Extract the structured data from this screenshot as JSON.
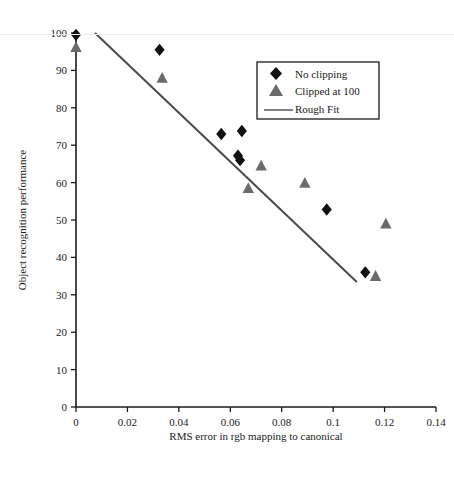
{
  "figure": {
    "background_color": "#ffffff",
    "axis_color": "#1a1a1a",
    "series_colors": {
      "no_clipping": "#111111",
      "clipped_at_100": "#6b6b6b",
      "rough_fit": "#4a4a4a"
    }
  },
  "chart_data": {
    "type": "scatter",
    "title": "",
    "xlabel": "RMS  error  in rgb mapping to canonical",
    "ylabel": "Object recognition performance",
    "xlim": [
      0,
      0.14
    ],
    "ylim": [
      0,
      100
    ],
    "xticks": [
      0,
      0.02,
      0.04,
      0.06,
      0.08,
      0.1,
      0.12,
      0.14
    ],
    "xtick_labels": [
      "0",
      "0.02",
      "0.04",
      "0.06",
      "0.08",
      "0.1",
      "0.12",
      "0.14"
    ],
    "yticks": [
      0,
      10,
      20,
      30,
      40,
      50,
      60,
      70,
      80,
      90,
      100
    ],
    "ytick_labels": [
      "0",
      "10",
      "20",
      "30",
      "40",
      "50",
      "60",
      "70",
      "80",
      "90",
      "100"
    ],
    "grid": false,
    "legend_position": "upper right",
    "series": [
      {
        "name": "No clipping",
        "marker": "diamond",
        "color": "#111111",
        "points": [
          {
            "x": 0.0,
            "y": 99.5
          },
          {
            "x": 0.0325,
            "y": 95.5
          },
          {
            "x": 0.0565,
            "y": 73.0
          },
          {
            "x": 0.0645,
            "y": 73.8
          },
          {
            "x": 0.063,
            "y": 67.2
          },
          {
            "x": 0.0638,
            "y": 66.0
          },
          {
            "x": 0.0975,
            "y": 52.8
          },
          {
            "x": 0.1125,
            "y": 36.0
          }
        ]
      },
      {
        "name": "Clipped at  100",
        "marker": "triangle",
        "color": "#6b6b6b",
        "points": [
          {
            "x": 0.0,
            "y": 96.2
          },
          {
            "x": 0.0335,
            "y": 88.0
          },
          {
            "x": 0.072,
            "y": 64.5
          },
          {
            "x": 0.067,
            "y": 58.5
          },
          {
            "x": 0.089,
            "y": 59.9
          },
          {
            "x": 0.1205,
            "y": 49.0
          },
          {
            "x": 0.1165,
            "y": 35.0
          }
        ]
      }
    ],
    "fit_line": {
      "name": "Rough Fit",
      "color": "#4a4a4a",
      "x0": 0.0074,
      "y0": 100.0,
      "x1": 0.1092,
      "y1": 33.4
    }
  },
  "legend": {
    "items": [
      {
        "label": "No clipping",
        "marker": "diamond"
      },
      {
        "label": "Clipped at  100",
        "marker": "triangle"
      },
      {
        "label": "Rough Fit",
        "marker": "line"
      }
    ]
  },
  "axis": {
    "x_title": "RMS  error  in rgb mapping to canonical",
    "y_title": "Object recognition performance",
    "x_labels": [
      "0",
      "0.02",
      "0.04",
      "0.06",
      "0.08",
      "0.1",
      "0.12",
      "0.14"
    ],
    "y_labels": [
      "0",
      "10",
      "20",
      "30",
      "40",
      "50",
      "60",
      "70",
      "80",
      "90",
      "100"
    ]
  }
}
